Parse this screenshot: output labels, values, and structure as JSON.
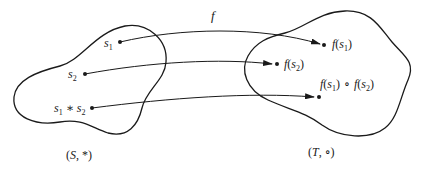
{
  "diagram": {
    "type": "homomorphism-mapping",
    "colors": {
      "stroke": "#1a1a1a",
      "background": "#ffffff"
    },
    "map_label": "f",
    "domain_set": {
      "label": "(S, *)",
      "label_parts": {
        "open": "(",
        "name": "S",
        "sep": ", ",
        "op": "*",
        "close": ")"
      },
      "elements": [
        {
          "id": "s1",
          "base": "s",
          "sub": "1"
        },
        {
          "id": "s2",
          "base": "s",
          "sub": "2"
        },
        {
          "id": "s1s2",
          "parts": [
            {
              "base": "s",
              "sub": "1"
            },
            {
              "op": "∗"
            },
            {
              "base": "s",
              "sub": "2"
            }
          ]
        }
      ]
    },
    "codomain_set": {
      "label": "(T, ∘)",
      "label_parts": {
        "open": "(",
        "name": "T",
        "sep": ", ",
        "op": "∘",
        "close": ")"
      },
      "elements": [
        {
          "id": "fs1",
          "text": "f(s1)",
          "fn": "f",
          "base": "s",
          "sub": "1"
        },
        {
          "id": "fs2",
          "text": "f(s2)",
          "fn": "f",
          "base": "s",
          "sub": "2"
        },
        {
          "id": "fs1fs2",
          "text": "f(s1) ∘ f(s2)",
          "op": "∘"
        }
      ]
    },
    "arrows": [
      {
        "from": "s1",
        "to": "fs1"
      },
      {
        "from": "s2",
        "to": "fs2"
      },
      {
        "from": "s1s2",
        "to": "fs1fs2"
      }
    ]
  }
}
